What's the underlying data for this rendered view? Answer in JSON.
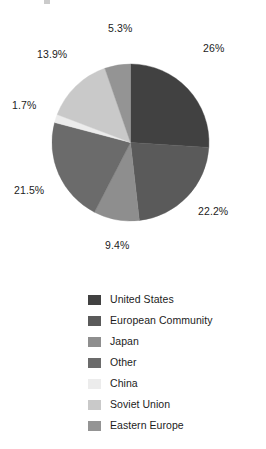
{
  "chart_data": {
    "type": "pie",
    "title": "",
    "categories": [
      "United States",
      "European Community",
      "Japan",
      "Other",
      "China",
      "Soviet Union",
      "Eastern Europe"
    ],
    "values": [
      26,
      22.2,
      9.4,
      21.5,
      1.7,
      13.9,
      5.3
    ],
    "value_labels": [
      "26%",
      "22.2%",
      "9.4%",
      "21.5%",
      "1.7%",
      "13.9%",
      "5.3%"
    ],
    "colors": [
      "#414141",
      "#5a5a5a",
      "#8e8e8e",
      "#6b6b6b",
      "#ececec",
      "#c9c9c9",
      "#949494"
    ],
    "start_angle_deg": 0,
    "direction": "clockwise",
    "legend_position": "bottom",
    "grid": false,
    "xlabel": "",
    "ylabel": ""
  },
  "labels": {
    "united_states": "26%",
    "european_community": "22.2%",
    "japan": "9.4%",
    "other": "21.5%",
    "china": "1.7%",
    "soviet_union": "13.9%",
    "eastern_europe": "5.3%"
  },
  "legend": {
    "items": [
      {
        "label": "United States",
        "color": "#414141"
      },
      {
        "label": "European Community",
        "color": "#5a5a5a"
      },
      {
        "label": "Japan",
        "color": "#8e8e8e"
      },
      {
        "label": "Other",
        "color": "#6b6b6b"
      },
      {
        "label": "China",
        "color": "#ececec"
      },
      {
        "label": "Soviet Union",
        "color": "#c9c9c9"
      },
      {
        "label": "Eastern Europe",
        "color": "#949494"
      }
    ]
  }
}
